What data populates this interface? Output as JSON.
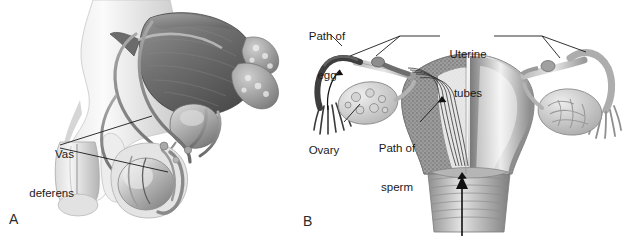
{
  "figure": {
    "background_color": "#ffffff",
    "ink_color": "#1a1a1a",
    "style": "grayscale anatomical line-and-wash illustration"
  },
  "panels": [
    {
      "letter": "A",
      "name": "male-reproductive-system",
      "labels": [
        {
          "id": "vas-deferens",
          "text": "Vas\ndeferens",
          "line1": "Vas",
          "line2": "deferens",
          "x": 18,
          "y": 124
        }
      ]
    },
    {
      "letter": "B",
      "name": "female-reproductive-system",
      "labels": [
        {
          "id": "path-of-egg",
          "text": "Path of\negg",
          "line1": "Path of",
          "line2": "egg",
          "x": 298,
          "y": 6
        },
        {
          "id": "uterine-tubes",
          "text": "Uterine\ntubes",
          "line1": "Uterine",
          "line2": "tubes",
          "x": 443,
          "y": 24
        },
        {
          "id": "ovary",
          "text": "Ovary",
          "line1": "Ovary",
          "line2": "",
          "x": 301,
          "y": 120
        },
        {
          "id": "path-of-sperm",
          "text": "Path of\nsperm",
          "line1": "Path of",
          "line2": "sperm",
          "x": 372,
          "y": 118
        }
      ]
    }
  ],
  "panel_letters": {
    "a": "A",
    "b": "B"
  },
  "colors": {
    "bladder_dark": "#6d6d6d",
    "bladder_darker": "#4f4f4f",
    "tube_gray": "#8c8c8c",
    "body_light": "#d8d8d8",
    "body_highlight": "#f2f2f2",
    "endometrium": "#8a8a8a",
    "myometrium": "#c9c9c9",
    "fimbriae_dark": "#4a4a4a",
    "leader_line": "#1a1a1a"
  }
}
